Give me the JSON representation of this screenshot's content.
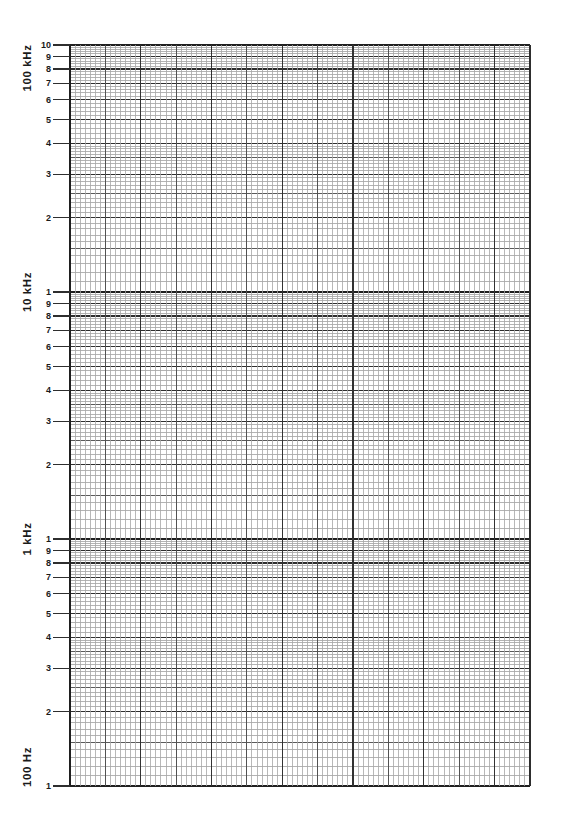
{
  "chart_data": {
    "type": "line",
    "title": "",
    "subtitle": "",
    "series": [],
    "legend": false,
    "grid": true,
    "y_axis": {
      "scale": "log",
      "unit": "frequency",
      "range": [
        "100 Hz",
        "100 kHz"
      ],
      "decade_labels": [
        "100 kHz",
        "10 kHz",
        "1 kHz",
        "100 Hz"
      ],
      "tick_numbers": [
        "10",
        "9",
        "8",
        "7",
        "6",
        "5",
        "4",
        "3",
        "2",
        "1"
      ],
      "decades": 3,
      "minor_divisions": {
        "from_1_to_4": 0.1,
        "from_4_to_10": 0.2
      }
    },
    "x_axis": {
      "scale": "linear",
      "tick_labels": [],
      "labels_visible": false
    }
  },
  "colors": {
    "paper": "#ffffff",
    "line_decade": "#1f1f1f",
    "line_major": "#2e2e2e",
    "line_mid": "#5a5a5a",
    "line_minor": "#a0a0a0",
    "line_v_heavy": "#323232",
    "line_v_medium": "#525252",
    "line_v_fine": "#a6a6a6",
    "text": "#1a1a1a"
  }
}
